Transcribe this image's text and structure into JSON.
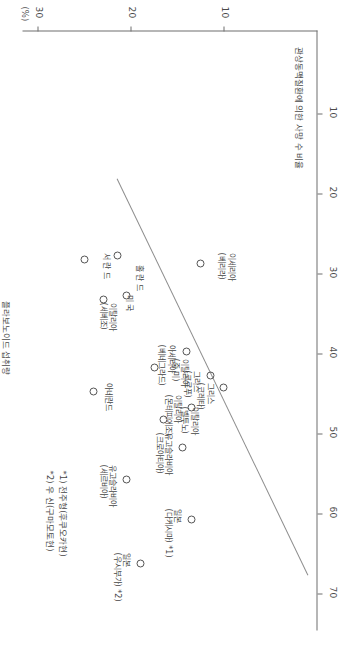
{
  "figure": {
    "unit_label": "(%)",
    "x_axis_title": "플라보노이드 섭취량",
    "y_axis_title": "관상동맥질환에 의한 사망 수 비율"
  },
  "chart_data": {
    "type": "scatter",
    "title": "",
    "xlabel": "플라보노이드 섭취량",
    "ylabel": "관상동맥질환에 의한 사망 수 비율",
    "unit": "(%)",
    "xlim": [
      0,
      75
    ],
    "ylim": [
      0,
      32
    ],
    "xticks": [
      10,
      20,
      30,
      40,
      50,
      60,
      70
    ],
    "yticks": [
      10,
      20,
      30
    ],
    "grid": false,
    "legend": false,
    "trendline": {
      "x1": 18.5,
      "y1": 21.5,
      "x2": 68.0,
      "y2": 1.0
    },
    "points": [
      {
        "label": "홀 란 드",
        "x": 28.0,
        "y": 21.5
      },
      {
        "label": "서 란 드",
        "x": 28.5,
        "y": 25.0
      },
      {
        "label": "미 국",
        "x": 33.5,
        "y": 23.0
      },
      {
        "label": "이탈리아\n(세베조)",
        "x": 33.0,
        "y": 20.5
      },
      {
        "label": "이세리아\n(베리라)",
        "x": 29.0,
        "y": 12.5
      },
      {
        "label": "아세리아\n(베네그라드)",
        "x": 40.0,
        "y": 14.0
      },
      {
        "label": "이탈리아\n(중 미)",
        "x": 42.0,
        "y": 17.5
      },
      {
        "label": "그리스\n(코르푸)",
        "x": 43.0,
        "y": 11.5
      },
      {
        "label": "그리스\n(크레타)",
        "x": 44.5,
        "y": 10.0
      },
      {
        "label": "아네란드",
        "x": 45.0,
        "y": 24.0
      },
      {
        "label": "이탈리아\n(몬테피에조)",
        "x": 47.0,
        "y": 13.5
      },
      {
        "label": "이탈리아\n(벨투노)",
        "x": 48.5,
        "y": 16.5
      },
      {
        "label": "유고슬라비아\n(크로아티아)",
        "x": 52.0,
        "y": 14.5
      },
      {
        "label": "유고슬라비아\n(세르비아)",
        "x": 56.0,
        "y": 20.5
      },
      {
        "label": "일본\n(다케시마) *1)",
        "x": 61.0,
        "y": 13.5
      },
      {
        "label": "일본\n(우시부가) *2)",
        "x": 66.5,
        "y": 19.0
      }
    ],
    "annotations": [
      "*1) 전주형(후쿠오카현)",
      "*2) 우 신(구마모토현)"
    ]
  }
}
